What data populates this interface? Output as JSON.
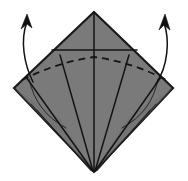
{
  "figure": {
    "title": "Origami fold step diagram",
    "canvas": {
      "width": 188,
      "height": 181
    },
    "background_color": "#ffffff"
  },
  "colors": {
    "paper_fill": "#7a7a7a",
    "paper_fill_shadow": "#6f6f6f",
    "outline": "#1a1a1a",
    "crease_line": "#141414",
    "dashed_crease": "#141414",
    "thin_arc": "#1f1f1f",
    "arrow": "#111111",
    "layer_white": "#ffffff"
  },
  "shape": {
    "name": "diamond-kite",
    "vertices": {
      "top": {
        "x": 94,
        "y": 12
      },
      "left": {
        "x": 14,
        "y": 88
      },
      "right": {
        "x": 173,
        "y": 88
      },
      "bottom": {
        "x": 94,
        "y": 172
      }
    },
    "outline_path": "M 94 12 L 173 88 L 94 172 L 14 88 Z"
  },
  "creases": {
    "center_vertical": {
      "label": "center vertical crease",
      "path": "M 94 13 L 94 171",
      "style": "solid",
      "width": 1.5
    },
    "horizontal_edge": {
      "label": "horizontal raw edge",
      "path": "M 52 50 L 137 50",
      "style": "solid",
      "width": 1.6
    },
    "fan_lines": [
      {
        "label": "fan crease left outer",
        "path": "M 93 171 L 26 77",
        "style": "solid",
        "width": 1.5
      },
      {
        "label": "fan crease left inner",
        "path": "M 93 171 L 60 55",
        "style": "solid",
        "width": 1.5
      },
      {
        "label": "fan crease right inner",
        "path": "M 95 171 L 129 55",
        "style": "solid",
        "width": 1.5
      },
      {
        "label": "fan crease right outer",
        "path": "M 95 171 L 161 77",
        "style": "solid",
        "width": 1.5
      }
    ],
    "dashed_valley_fold": {
      "label": "valley fold arc",
      "path": "M 22 80 Q 58 62 94 57 Q 132 62 166 80",
      "style": "dashed",
      "dash_pattern": "7 5",
      "width": 1.7
    },
    "thin_arcs": [
      {
        "label": "thin arc lower left",
        "path": "M 29 79 Q 36 112 66 128",
        "style": "solid",
        "width": 0.9
      },
      {
        "label": "thin arc lower right",
        "path": "M 158 79 Q 152 112 122 128",
        "style": "solid",
        "width": 0.9
      }
    ],
    "layer_edges": [
      {
        "label": "layer edge left a",
        "path": "M 92 171 L 31 104",
        "style": "solid",
        "width": 0.8
      },
      {
        "label": "layer edge left b",
        "path": "M 91 171 L 37 110",
        "style": "solid",
        "width": 0.8
      },
      {
        "label": "layer edge right a",
        "path": "M 96 171 L 156 104",
        "style": "solid",
        "width": 0.8
      },
      {
        "label": "layer edge right b",
        "path": "M 97 171 L 150 110",
        "style": "solid",
        "width": 0.8
      }
    ]
  },
  "arrows": [
    {
      "name": "left-fold-arrow",
      "direction": "up-left",
      "meaning": "swing left flap upward",
      "tail": {
        "x": 33,
        "y": 82
      },
      "head": {
        "x": 28,
        "y": 17
      },
      "path": "M 33 82 C 24 64 20 40 27 22",
      "head_path": "M 27 14 L 32 28 L 27 24 L 21 29 Z"
    },
    {
      "name": "right-fold-arrow",
      "direction": "up-right",
      "meaning": "swing right flap upward",
      "tail": {
        "x": 156,
        "y": 84
      },
      "head": {
        "x": 164,
        "y": 18
      },
      "path": "M 156 84 C 168 66 170 40 164 23",
      "head_path": "M 165 14 L 170 30 L 164 25 L 159 30 Z"
    }
  ]
}
